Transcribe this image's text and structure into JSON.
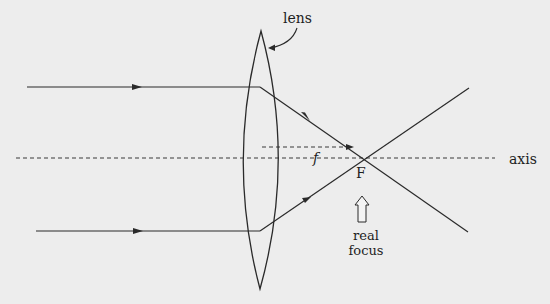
{
  "diagram": {
    "labels": {
      "lens": "lens",
      "axis": "axis",
      "focal_length": "f",
      "focus_point": "F",
      "focus_caption_line1": "real",
      "focus_caption_line2": "focus"
    },
    "elements": {
      "lens": {
        "top": [
          261,
          31
        ],
        "bottom": [
          260,
          289
        ],
        "left_extent": 243,
        "right_extent": 279
      },
      "principal_axis": {
        "y": 158,
        "x_start": 16,
        "x_end": 495,
        "style": "dashed"
      },
      "focal_length_arrow": {
        "y": 147,
        "x_start": 262,
        "x_end": 352,
        "style": "dashed"
      },
      "focus_point": [
        362,
        159
      ],
      "rays": [
        {
          "name": "upper-incident",
          "from": [
            27,
            87
          ],
          "to": [
            260,
            87
          ]
        },
        {
          "name": "upper-refracted",
          "from": [
            260,
            87
          ],
          "to": [
            468,
            232
          ]
        },
        {
          "name": "lower-incident",
          "from": [
            36,
            231
          ],
          "to": [
            260,
            231
          ]
        },
        {
          "name": "lower-refracted",
          "from": [
            260,
            231
          ],
          "to": [
            469,
            88
          ]
        }
      ]
    },
    "colors": {
      "background": "#ededed",
      "ink": "#2a2a2a"
    }
  }
}
